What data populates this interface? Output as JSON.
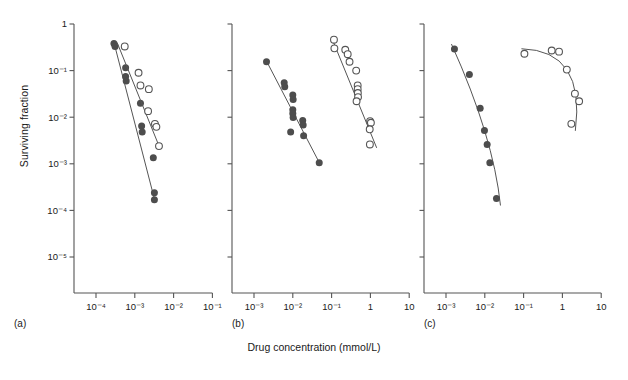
{
  "figure": {
    "x_axis_label": "Drug concentration (mmol/L)",
    "y_axis_label": "Surviving fraction",
    "panel_tags": [
      "(a)",
      "(b)",
      "(c)"
    ],
    "colors": {
      "axis": "#555555",
      "text": "#1a1a1a",
      "filled_marker": "#4d4d4d",
      "open_marker_stroke": "#555555",
      "fit_line": "#555555",
      "background": "#ffffff"
    }
  },
  "chart_data": [
    {
      "type": "scatter",
      "panel": "(a)",
      "title": "",
      "xlabel": "Drug concentration (mmol/L)",
      "ylabel": "Surviving fraction",
      "xscale": "log",
      "yscale": "log",
      "xlim": [
        3.16e-05,
        0.316
      ],
      "ylim": [
        3.16e-06,
        1
      ],
      "xticks": [
        0.0001,
        0.001,
        0.01,
        0.1
      ],
      "xticklabels": [
        "10⁻⁴",
        "10⁻³",
        "10⁻²",
        "10⁻¹"
      ],
      "yticks": [
        1,
        0.1,
        0.01,
        0.001,
        0.0001,
        1e-05
      ],
      "yticklabels": [
        "1",
        "10⁻¹",
        "10⁻²",
        "10⁻³",
        "10⁻⁴",
        "10⁻⁵"
      ],
      "grid": false,
      "legend": "none",
      "series": [
        {
          "name": "sensitive (filled circles)",
          "marker": "filled-circle",
          "points": [
            [
              0.00029,
              0.38
            ],
            [
              0.00031,
              0.33
            ],
            [
              0.00058,
              0.115
            ],
            [
              0.00058,
              0.075
            ],
            [
              0.0006,
              0.06
            ],
            [
              0.0014,
              0.02
            ],
            [
              0.0015,
              0.0065
            ],
            [
              0.00155,
              0.0048
            ],
            [
              0.003,
              0.00135
            ],
            [
              0.0032,
              0.00024
            ],
            [
              0.0032,
              0.00017
            ]
          ],
          "fit_line": [
            [
              0.00029,
              0.4
            ],
            [
              0.0033,
              0.00016
            ]
          ]
        },
        {
          "name": "resistant (open circles)",
          "marker": "open-circle",
          "points": [
            [
              0.00055,
              0.33
            ],
            [
              0.00125,
              0.09
            ],
            [
              0.0014,
              0.048
            ],
            [
              0.0023,
              0.04
            ],
            [
              0.0022,
              0.0135
            ],
            [
              0.0033,
              0.0072
            ],
            [
              0.0036,
              0.0062
            ],
            [
              0.0042,
              0.0024
            ]
          ],
          "fit_line": [
            [
              0.00035,
              0.4
            ],
            [
              0.0044,
              0.0022
            ]
          ]
        }
      ]
    },
    {
      "type": "scatter",
      "panel": "(b)",
      "title": "",
      "xlabel": "Drug concentration (mmol/L)",
      "ylabel": "Surviving fraction",
      "xscale": "log",
      "yscale": "log",
      "xlim": [
        0.000316,
        31.6
      ],
      "ylim": [
        3.16e-06,
        1
      ],
      "xticks": [
        0.001,
        0.01,
        0.1,
        1,
        10
      ],
      "xticklabels": [
        "10⁻³",
        "10⁻²",
        "10⁻¹",
        "1",
        "10"
      ],
      "yticks": [
        1,
        0.1,
        0.01,
        0.001,
        0.0001,
        1e-05
      ],
      "yticklabels": [
        "",
        "",
        "",
        "",
        "",
        ""
      ],
      "grid": false,
      "legend": "none",
      "series": [
        {
          "name": "sensitive (filled circles)",
          "marker": "filled-circle",
          "points": [
            [
              0.0021,
              0.155
            ],
            [
              0.006,
              0.055
            ],
            [
              0.0062,
              0.045
            ],
            [
              0.01,
              0.03
            ],
            [
              0.0102,
              0.024
            ],
            [
              0.01,
              0.0145
            ],
            [
              0.01,
              0.012
            ],
            [
              0.0102,
              0.0098
            ],
            [
              0.0088,
              0.0048
            ],
            [
              0.018,
              0.0085
            ],
            [
              0.0185,
              0.0068
            ],
            [
              0.019,
              0.004
            ],
            [
              0.048,
              0.00105
            ]
          ],
          "fit_line": [
            [
              0.0021,
              0.16
            ],
            [
              0.05,
              0.001
            ]
          ]
        },
        {
          "name": "resistant (open circles)",
          "marker": "open-circle",
          "points": [
            [
              0.115,
              0.46
            ],
            [
              0.118,
              0.3
            ],
            [
              0.225,
              0.28
            ],
            [
              0.26,
              0.225
            ],
            [
              0.29,
              0.155
            ],
            [
              0.43,
              0.1
            ],
            [
              0.47,
              0.048
            ],
            [
              0.47,
              0.04
            ],
            [
              0.475,
              0.033
            ],
            [
              0.48,
              0.027
            ],
            [
              0.44,
              0.022
            ],
            [
              0.98,
              0.0082
            ],
            [
              1.03,
              0.0076
            ],
            [
              0.96,
              0.0055
            ],
            [
              0.97,
              0.0026
            ]
          ],
          "fit_line": [
            [
              0.11,
              0.42
            ],
            [
              1.45,
              0.0022
            ]
          ]
        }
      ]
    },
    {
      "type": "scatter",
      "panel": "(c)",
      "title": "",
      "xlabel": "Drug concentration (mmol/L)",
      "ylabel": "Surviving fraction",
      "xscale": "log",
      "yscale": "log",
      "xlim": [
        0.000316,
        31.6
      ],
      "ylim": [
        3.16e-06,
        1
      ],
      "xticks": [
        0.001,
        0.01,
        0.1,
        1,
        10
      ],
      "xticklabels": [
        "10⁻³",
        "10⁻²",
        "10⁻¹",
        "1",
        "10"
      ],
      "yticks": [
        1,
        0.1,
        0.01,
        0.001,
        0.0001,
        1e-05
      ],
      "yticklabels": [
        "",
        "",
        "",
        "",
        "",
        ""
      ],
      "grid": false,
      "legend": "none",
      "series": [
        {
          "name": "sensitive (filled circles)",
          "marker": "filled-circle",
          "points": [
            [
              0.00165,
              0.29
            ],
            [
              0.004,
              0.082
            ],
            [
              0.0076,
              0.0155
            ],
            [
              0.0098,
              0.0052
            ],
            [
              0.0115,
              0.0026
            ],
            [
              0.0135,
              0.00105
            ],
            [
              0.02,
              0.00018
            ]
          ],
          "fit_line_curved": true
        },
        {
          "name": "resistant (open circles)",
          "marker": "open-circle",
          "points": [
            [
              0.105,
              0.23
            ],
            [
              0.53,
              0.27
            ],
            [
              0.82,
              0.255
            ],
            [
              1.3,
              0.105
            ],
            [
              2.1,
              0.032
            ],
            [
              2.7,
              0.022
            ],
            [
              1.7,
              0.0072
            ]
          ],
          "fit_line_curved": true
        }
      ]
    }
  ]
}
